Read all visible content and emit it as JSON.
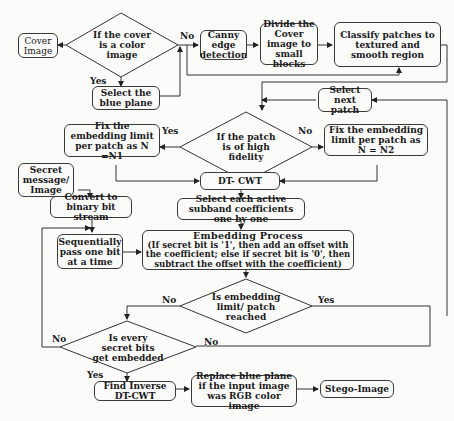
{
  "diagram": {
    "nodes": {
      "cover_image": "Cover Image",
      "is_color": "If the cover is a color image",
      "select_blue": "Select the blue plane",
      "canny": "Canny edge detection",
      "divide": "Divide the Cover image to small blocks",
      "classify": "Classify patches to textured and smooth region",
      "select_next": "Select next patch",
      "high_fidelity": "If the patch is of high fidelity",
      "fix_n1": "Fix the embedding limit per patch as N =N1",
      "fix_n2": "Fix the embedding limit per patch as N = N2",
      "dtcwt": "DT- CWT",
      "secret": "Secret message/ Image",
      "convert": "Convert to binary bit stream",
      "select_subband": "Select each active subband coefficients one by one",
      "sequential": "Sequentially pass one bit at a time",
      "embedding_title": "Embedding Process",
      "embedding_body": "(If secret bit is '1', then add an offset with the coefficient; else if secret bit is '0', then subtract the offset with the coefficient)",
      "limit_reached": "Is embedding limit/ patch reached",
      "all_embedded": "Is every secret bits get embedded",
      "inverse": "Find Inverse DT-CWT",
      "replace_blue": "Replace blue plane if the input image was RGB color image",
      "stego": "Stego-Image"
    },
    "edge_labels": {
      "color_no": "No",
      "color_yes": "Yes",
      "fidelity_yes": "Yes",
      "fidelity_no": "No",
      "limit_no": "No",
      "limit_yes": "Yes",
      "all_no_left": "No",
      "all_no_right": "No",
      "all_yes": "Yes"
    }
  }
}
